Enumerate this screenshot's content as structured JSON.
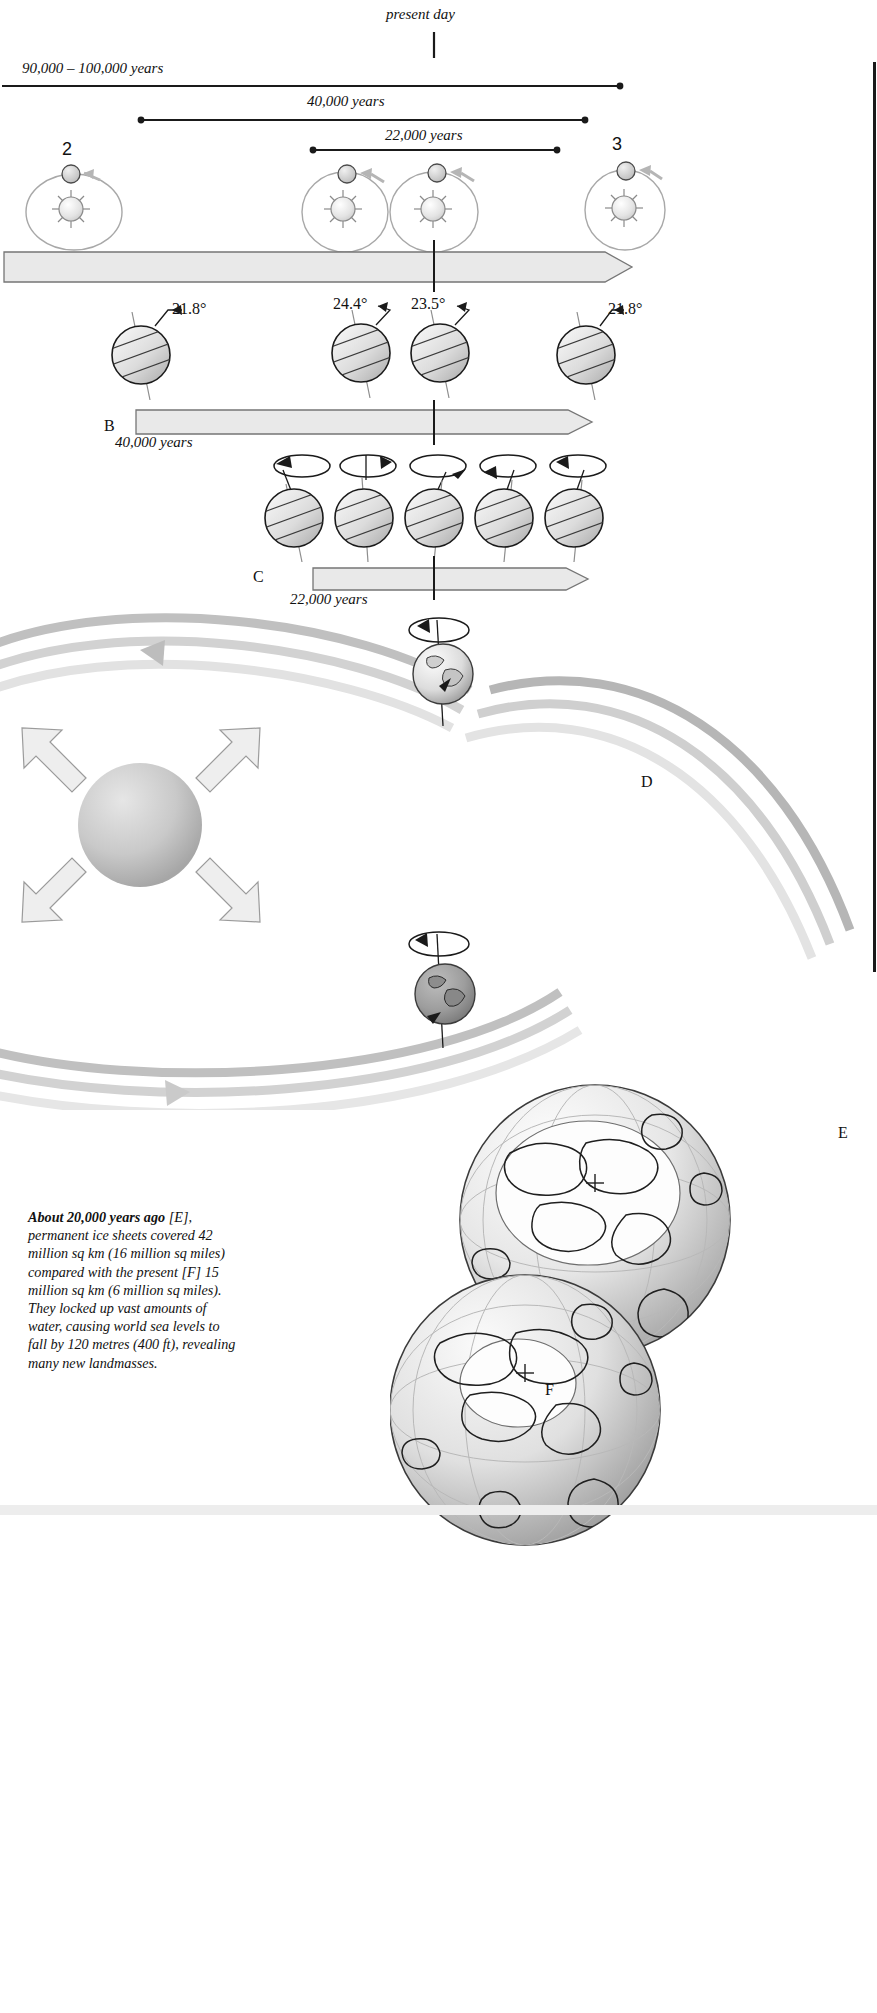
{
  "figure": {
    "title_note": "Milankovitch cycles and Ice Age Earth",
    "present_day_label": "present day"
  },
  "timelines": [
    {
      "id": "eccentricity",
      "label": "90,000 – 100,000 years"
    },
    {
      "id": "obliquity",
      "label": "40,000 years"
    },
    {
      "id": "precession",
      "label": "22,000 years"
    }
  ],
  "orbit_row": {
    "labels": [
      "2",
      "3"
    ],
    "icon": "sun-earth-orbit-icon",
    "arrow_direction": "counterclockwise"
  },
  "band_a": {
    "caption": ""
  },
  "section_b": {
    "letter": "B",
    "bar_caption": "40,000 years",
    "tilt_angles": [
      "21.8°",
      "24.4°",
      "23.5°",
      "21.8°"
    ]
  },
  "section_c": {
    "letter": "C",
    "bar_caption": "22,000 years",
    "globe_count": 5
  },
  "section_d": {
    "letter": "D"
  },
  "section_e": {
    "letter": "E"
  },
  "section_f": {
    "letter": "F"
  },
  "caption": {
    "lead": "About 20,000 years ago",
    "ref_e": "[E]",
    "body_1": ", permanent ice sheets covered 42 million sq km (16 million sq miles) compared with the present ",
    "ref_f": "[F]",
    "body_2": " 15 million sq km (6 million sq miles). They locked up vast amounts of water, causing world sea levels to fall by 120 metres (400 ft), revealing many new landmasses.",
    "full_text": "About 20,000 years ago [E], permanent ice sheets covered 42 million sq km (16 million sq miles) compared with the present [F] 15 million sq km (6 million sq miles). They locked up vast amounts of water, causing world sea levels to fall by 120 metres (400 ft), revealing many new landmasses."
  },
  "colors": {
    "ink": "#1a1a1a",
    "band_fill": "#e8e8e8",
    "band_stroke": "#6d6d6d",
    "globe_light": "#f2f2f2",
    "globe_mid": "#cfcfcf",
    "globe_dark": "#9a9a9a",
    "orbit_ring": "#b9b9b9",
    "arrow_gray": "#d9d9d9"
  }
}
